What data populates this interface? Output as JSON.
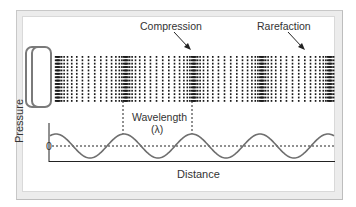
{
  "diagram": {
    "labels": {
      "compression": "Compression",
      "rarefaction": "Rarefaction",
      "wavelength": "Wavelength",
      "wavelength_symbol": "(λ)",
      "y_axis": "Pressure",
      "x_axis": "Distance",
      "zero": "0"
    },
    "colors": {
      "frame": "#ececec",
      "background": "#ffffff",
      "dots": "#1a1a1a",
      "wave": "#6e6e6e",
      "axis": "#222222",
      "speaker": "#7a7a7a",
      "text": "#333333"
    },
    "particle_field": {
      "x_start": 55,
      "x_end": 334,
      "y_start": 56,
      "y_end": 100,
      "rows": 14,
      "compression_centers_x": [
        57,
        124,
        192,
        262,
        330
      ],
      "period_px": 68
    },
    "wave": {
      "baseline_y": 146,
      "amplitude_px": 12,
      "x_start": 50,
      "x_end": 334,
      "crest_x": [
        124,
        192,
        262
      ],
      "axis_y": 161
    },
    "wavelength_markers_x": [
      123,
      192
    ]
  }
}
